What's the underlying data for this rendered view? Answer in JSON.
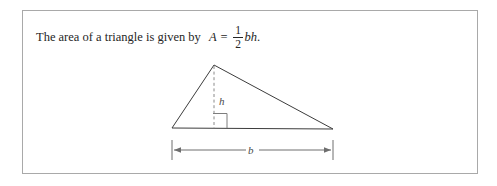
{
  "figure": {
    "caption": {
      "lead": "The area of a triangle is given by",
      "variable_A": "A",
      "equals": "=",
      "fraction_numerator": "1",
      "fraction_denominator": "2",
      "product": "bh",
      "period": "."
    },
    "diagram": {
      "type": "geometry-triangle",
      "height_label": "h",
      "base_label": "b",
      "right_angle_marker": "right-angle-square",
      "vertices": {
        "apex": [
          214,
          65
        ],
        "left": [
          172,
          128
        ],
        "right": [
          333,
          129
        ]
      },
      "height_line": {
        "from": [
          214,
          65
        ],
        "to": [
          214,
          128
        ],
        "style": "dashed"
      },
      "base_dimension_line": {
        "from": [
          172,
          150
        ],
        "to": [
          333,
          150
        ],
        "arrows": "both"
      }
    },
    "colors": {
      "frame_border": "#a9a9a9",
      "triangle_stroke": "#3c3c3c",
      "dashed_stroke": "#8a8a8a",
      "dimension_stroke": "#6e6e6e",
      "text": "#262626",
      "background": "#ffffff"
    }
  }
}
